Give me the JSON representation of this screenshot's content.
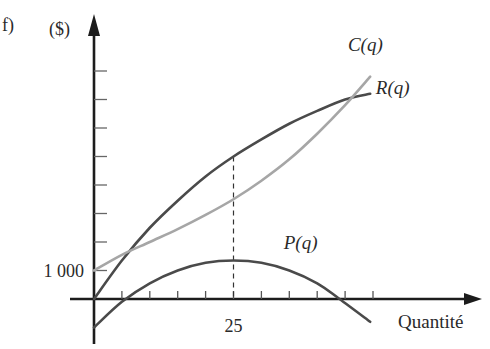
{
  "figure_label": "f)",
  "chart_data": {
    "type": "line",
    "title": "",
    "ylabel": "($)",
    "xlabel": "Quantité",
    "x_ticks": {
      "step": 5,
      "count": 10,
      "labeled": [
        {
          "value": 25,
          "label": "25"
        }
      ]
    },
    "y_ticks": {
      "step": 1000,
      "count": 8,
      "labeled": [
        {
          "value": 1000,
          "label": "1 000"
        }
      ]
    },
    "xlim": [
      0,
      55
    ],
    "ylim": [
      -1100,
      8300
    ],
    "grid": false,
    "annotations": [
      {
        "type": "dashed-vertical",
        "x": 25,
        "from_y": 1350,
        "to_y": 5000
      }
    ],
    "series": [
      {
        "name": "R(q)",
        "color": "#4a4a4a",
        "label_pos": [
          50.5,
          7200
        ],
        "x": [
          0,
          5,
          10,
          15,
          20,
          25,
          30,
          35,
          40,
          45,
          49.5
        ],
        "y": [
          0,
          1350,
          2500,
          3450,
          4300,
          5000,
          5600,
          6150,
          6600,
          7000,
          7200
        ]
      },
      {
        "name": "C(q)",
        "color": "#a6a6a6",
        "label_pos": [
          45.5,
          8700
        ],
        "x": [
          0,
          5,
          10,
          15,
          20,
          25,
          30,
          35,
          40,
          45,
          49.5
        ],
        "y": [
          1000,
          1550,
          2000,
          2450,
          2950,
          3500,
          4150,
          4900,
          5800,
          6800,
          7800
        ]
      },
      {
        "name": "P(q)",
        "color": "#4a4a4a",
        "label_pos": [
          34,
          1750
        ],
        "x": [
          0,
          5,
          10,
          15,
          20,
          25,
          30,
          35,
          40,
          44,
          49.5
        ],
        "y": [
          -1000,
          -100,
          550,
          1000,
          1270,
          1350,
          1270,
          1000,
          550,
          0,
          -800
        ]
      }
    ]
  }
}
